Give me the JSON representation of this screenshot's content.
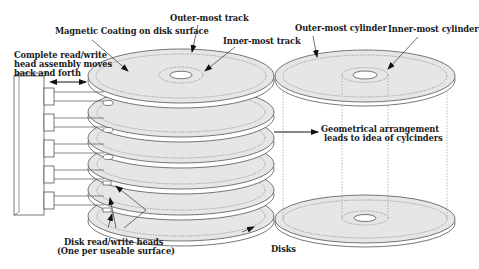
{
  "diagram": {
    "title": "",
    "labels": {
      "outer_track": "Outer-most track",
      "magnetic_coating": "Magnetic Coating on disk surface",
      "inner_track": "Inner-most track",
      "head_assembly_line1": "Complete read/write",
      "head_assembly_line2": "head assembly moves",
      "head_assembly_line3": "back and forth",
      "outer_cylinder": "Outer-most cylinder",
      "inner_cylinder": "Inner-most cylinder",
      "geometry_line1": "Geometrical arrangement",
      "geometry_line2": "leads to idea of cylcinders",
      "heads_line1": "Disk read/write heads",
      "heads_line2": "(One per useable surface)",
      "disks": "Disks"
    },
    "platter_count": 6,
    "head_arm_count": 5,
    "colors": {
      "platter_fill": "#e6e6e6",
      "platter_edge": "#ffffff",
      "stroke": "#555555",
      "track_dash": "#777777",
      "text": "#1a1a1a"
    }
  }
}
